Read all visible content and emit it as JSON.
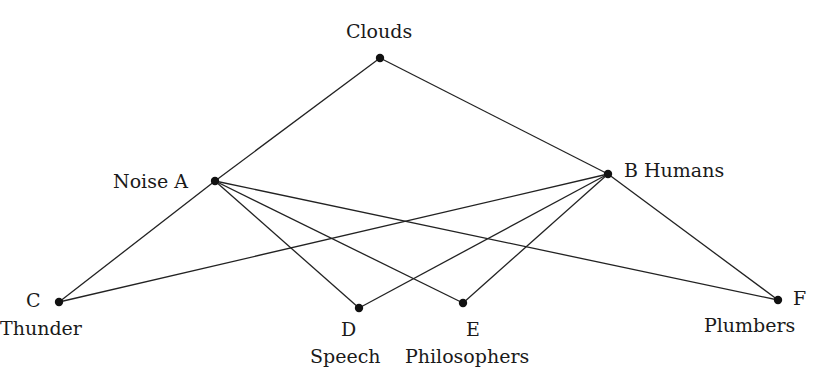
{
  "diagram": {
    "type": "graph",
    "colors": {
      "line": "#222222",
      "node": "#111111",
      "text": "#1a1a1a",
      "background": "#ffffff"
    },
    "nodes": [
      {
        "id": "clouds",
        "letter": "",
        "name": "Clouds",
        "x": 380,
        "y": 58
      },
      {
        "id": "A",
        "letter": "A",
        "name": "Noise",
        "x": 215,
        "y": 181
      },
      {
        "id": "B",
        "letter": "B",
        "name": "Humans",
        "x": 608,
        "y": 174
      },
      {
        "id": "C",
        "letter": "C",
        "name": "Thunder",
        "x": 59,
        "y": 302
      },
      {
        "id": "D",
        "letter": "D",
        "name": "Speech",
        "x": 359,
        "y": 308
      },
      {
        "id": "E",
        "letter": "E",
        "name": "Philosophers",
        "x": 463,
        "y": 303
      },
      {
        "id": "F",
        "letter": "F",
        "name": "Plumbers",
        "x": 778,
        "y": 300
      }
    ],
    "edges": [
      [
        "clouds",
        "A"
      ],
      [
        "clouds",
        "B"
      ],
      [
        "A",
        "C"
      ],
      [
        "A",
        "D"
      ],
      [
        "A",
        "E"
      ],
      [
        "A",
        "F"
      ],
      [
        "B",
        "C"
      ],
      [
        "B",
        "D"
      ],
      [
        "B",
        "E"
      ],
      [
        "B",
        "F"
      ]
    ],
    "labels": {
      "clouds": "Clouds",
      "A": "Noise A",
      "B": "B Humans",
      "C_letter": "C",
      "C_name": "Thunder",
      "D_letter": "D",
      "D_name": "Speech",
      "E_letter": "E",
      "E_name": "Philosophers",
      "F_letter": "F",
      "F_name": "Plumbers"
    }
  }
}
